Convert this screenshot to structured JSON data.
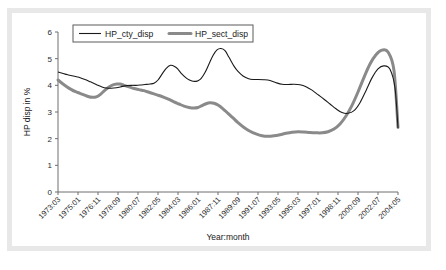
{
  "figure": {
    "caption": "",
    "background_color": "#ffffff",
    "frame_color": "#e8e8e8"
  },
  "chart_data": {
    "type": "line",
    "title": "",
    "xlabel": "Year:month",
    "ylabel": "HP disp in %",
    "ylim": [
      0,
      6
    ],
    "yticks": [
      0,
      1,
      2,
      3,
      4,
      5,
      6
    ],
    "grid": false,
    "legend_position": "top-left",
    "categories": [
      "1973:03",
      "1975:01",
      "1976:11",
      "1978:09",
      "1980:07",
      "1982:05",
      "1984:03",
      "1986:01",
      "1987:11",
      "1989:09",
      "1991:07",
      "1993:05",
      "1995:03",
      "1997:01",
      "1998:11",
      "2000:09",
      "2002:07",
      "2004:05"
    ],
    "series": [
      {
        "name": "HP_cty_disp",
        "color": "#1a1a1a",
        "linewidth": 1,
        "values": [
          4.5,
          4.28,
          3.9,
          4.0,
          4.02,
          4.75,
          4.15,
          5.38,
          4.4,
          4.22,
          4.05,
          3.95,
          3.5,
          2.95,
          3.6,
          4.72,
          4.45,
          2.4
        ],
        "dense_x": [
          0,
          0.18,
          0.35,
          0.52,
          0.7,
          0.88,
          1.0,
          1.2,
          1.42,
          1.62,
          1.8,
          2.0,
          2.2,
          2.42,
          2.62,
          2.8,
          3.0,
          3.22,
          3.45,
          3.7,
          3.9,
          4.1,
          4.35,
          4.6,
          4.8,
          5.0,
          5.2,
          5.4,
          5.62,
          5.85,
          6.0,
          6.2,
          6.45,
          6.7,
          6.9,
          7.0,
          7.15,
          7.35,
          7.55,
          7.75,
          7.95,
          8.15,
          8.35,
          8.55,
          8.8,
          9.0,
          9.25,
          9.5,
          9.75,
          10.0,
          10.3,
          10.6,
          10.9,
          11.2,
          11.5,
          11.8,
          12.1,
          12.4,
          12.7,
          13.0,
          13.3,
          13.6,
          13.9,
          14.2,
          14.5,
          14.8,
          15.1,
          15.4,
          15.7,
          16.0,
          16.3,
          16.6,
          16.85,
          17.0
        ],
        "dense_y": [
          4.5,
          4.46,
          4.42,
          4.39,
          4.36,
          4.33,
          4.31,
          4.26,
          4.2,
          4.13,
          4.07,
          4.0,
          3.94,
          3.9,
          3.89,
          3.9,
          3.92,
          3.96,
          3.99,
          4.0,
          4.0,
          4.01,
          4.03,
          4.05,
          4.08,
          4.2,
          4.42,
          4.63,
          4.75,
          4.7,
          4.6,
          4.42,
          4.25,
          4.16,
          4.15,
          4.17,
          4.25,
          4.48,
          4.8,
          5.12,
          5.33,
          5.38,
          5.3,
          5.05,
          4.72,
          4.52,
          4.35,
          4.26,
          4.22,
          4.22,
          4.21,
          4.18,
          4.1,
          4.04,
          4.03,
          4.04,
          4.02,
          3.95,
          3.82,
          3.65,
          3.48,
          3.3,
          3.12,
          2.98,
          2.95,
          3.05,
          3.35,
          3.8,
          4.28,
          4.62,
          4.73,
          4.6,
          3.9,
          2.4
        ]
      },
      {
        "name": "HP_sect_disp",
        "color": "#8a8a8a",
        "linewidth": 3,
        "values": [
          4.2,
          3.7,
          3.55,
          4.05,
          3.85,
          3.62,
          3.15,
          3.35,
          2.75,
          2.15,
          2.1,
          2.2,
          2.25,
          2.22,
          3.0,
          4.7,
          5.32,
          2.42
        ],
        "dense_x": [
          0,
          0.2,
          0.42,
          0.65,
          0.88,
          1.1,
          1.3,
          1.5,
          1.72,
          1.95,
          2.15,
          2.35,
          2.55,
          2.75,
          2.95,
          3.1,
          3.3,
          3.55,
          3.8,
          4.05,
          4.3,
          4.55,
          4.8,
          5.05,
          5.3,
          5.55,
          5.8,
          6.05,
          6.3,
          6.55,
          6.8,
          7.0,
          7.2,
          7.4,
          7.6,
          7.8,
          8.0,
          8.25,
          8.5,
          8.75,
          9.0,
          9.3,
          9.6,
          9.9,
          10.2,
          10.5,
          10.8,
          11.1,
          11.4,
          11.7,
          12.0,
          12.3,
          12.6,
          12.9,
          13.2,
          13.5,
          13.8,
          14.1,
          14.4,
          14.7,
          15.0,
          15.3,
          15.6,
          15.9,
          16.2,
          16.5,
          16.8,
          17.0
        ],
        "dense_y": [
          4.2,
          4.08,
          3.96,
          3.85,
          3.76,
          3.7,
          3.64,
          3.58,
          3.55,
          3.58,
          3.68,
          3.82,
          3.94,
          4.02,
          4.05,
          4.05,
          4.0,
          3.94,
          3.88,
          3.84,
          3.8,
          3.74,
          3.68,
          3.62,
          3.55,
          3.47,
          3.38,
          3.3,
          3.22,
          3.17,
          3.15,
          3.17,
          3.24,
          3.31,
          3.35,
          3.33,
          3.26,
          3.12,
          2.95,
          2.78,
          2.6,
          2.42,
          2.28,
          2.18,
          2.11,
          2.09,
          2.11,
          2.15,
          2.2,
          2.24,
          2.26,
          2.25,
          2.23,
          2.22,
          2.22,
          2.26,
          2.36,
          2.55,
          2.85,
          3.25,
          3.75,
          4.3,
          4.8,
          5.15,
          5.32,
          5.25,
          4.55,
          2.42
        ]
      }
    ]
  },
  "legend": {
    "entries": [
      {
        "label": "HP_cty_disp"
      },
      {
        "label": "HP_sect_disp"
      }
    ]
  }
}
